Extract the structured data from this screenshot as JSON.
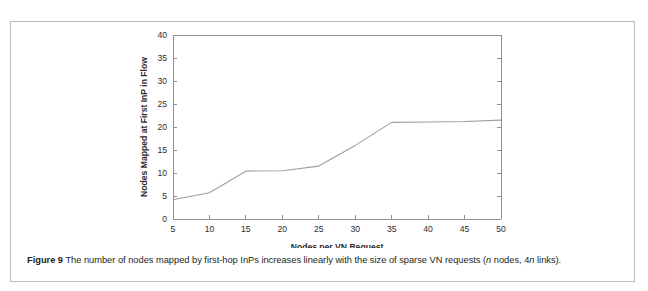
{
  "page": {
    "clipped_top_text": "",
    "background_color": "#ffffff",
    "border_color": "#b9bbbe"
  },
  "caption": {
    "figure_number": "Figure 9",
    "text_part_1": " The number of nodes mapped by first-hop InPs increases linearly with the size of sparse VN requests (",
    "italic_n_1": "n",
    "text_part_2": " nodes, 4",
    "italic_n_2": "n",
    "text_part_3": " links)."
  },
  "chart_data": {
    "type": "line",
    "title": "",
    "subtitle": "",
    "xlabel": "Nodes per VN Request",
    "ylabel": "Nodes Mapped at First InP in Flow",
    "xlim": [
      5,
      50
    ],
    "ylim": [
      0,
      40
    ],
    "xticks": [
      5,
      10,
      15,
      20,
      25,
      30,
      35,
      40,
      45,
      50
    ],
    "yticks": [
      0,
      5,
      10,
      15,
      20,
      25,
      30,
      35,
      40
    ],
    "xtick_labels": [
      "5",
      "10",
      "15",
      "20",
      "25",
      "30",
      "35",
      "40",
      "45",
      "50"
    ],
    "ytick_labels": [
      "0",
      "5",
      "10",
      "15",
      "20",
      "25",
      "30",
      "35",
      "40"
    ],
    "grid": false,
    "legend": false,
    "legend_position": "none",
    "line_color": "#9d9fa3",
    "axis_color": "#8e9094",
    "series": [
      {
        "name": "Nodes Mapped at First InP in Flow",
        "x": [
          5,
          10,
          15,
          20,
          25,
          30,
          35,
          40,
          45,
          50
        ],
        "values": [
          4.2,
          5.7,
          10.4,
          10.5,
          11.5,
          16.0,
          21.0,
          21.1,
          21.2,
          21.5
        ]
      }
    ]
  }
}
